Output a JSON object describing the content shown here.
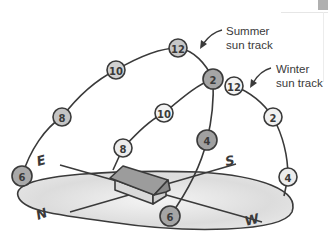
{
  "diagram": {
    "labels": {
      "summer": [
        "Summer",
        "sun track"
      ],
      "winter": [
        "Winter",
        "sun track"
      ]
    },
    "directions": {
      "east": "E",
      "south": "S",
      "west": "W",
      "north": "N"
    },
    "summer_track": {
      "nodes": [
        {
          "label": "6",
          "x": 22,
          "y": 176,
          "fill": "#a9a9a9"
        },
        {
          "label": "8",
          "x": 62,
          "y": 117,
          "fill": "#c4c4c4"
        },
        {
          "label": "10",
          "x": 116,
          "y": 70,
          "fill": "#d2d2d2"
        },
        {
          "label": "12",
          "x": 178,
          "y": 48,
          "fill": "#c8c8c8"
        },
        {
          "label": "2",
          "x": 213,
          "y": 79,
          "fill": "#a5a5a5"
        },
        {
          "label": "4",
          "x": 207,
          "y": 140,
          "fill": "#a0a0a0"
        },
        {
          "label": "6",
          "x": 170,
          "y": 216,
          "fill": "#a5a5a5"
        }
      ]
    },
    "winter_track": {
      "nodes": [
        {
          "label": "8",
          "x": 123,
          "y": 148,
          "fill": "#ececec"
        },
        {
          "label": "10",
          "x": 164,
          "y": 113,
          "fill": "#f2f2f2"
        },
        {
          "label": "12",
          "x": 234,
          "y": 86,
          "fill": "#f4f4f4"
        },
        {
          "label": "2",
          "x": 273,
          "y": 117,
          "fill": "#f0f0f0"
        },
        {
          "label": "4",
          "x": 288,
          "y": 177,
          "fill": "#ececec"
        }
      ]
    },
    "colors": {
      "stroke": "#3a3a3a",
      "ground": "#e4e4e4",
      "house_roof": "#9a9a9a",
      "house_wall": "#d6d6d6"
    }
  }
}
